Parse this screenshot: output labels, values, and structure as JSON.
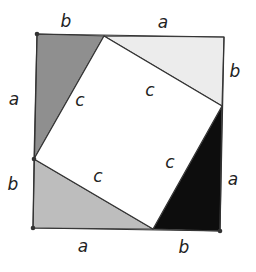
{
  "diagram": {
    "outer_square": {
      "points": [
        [
          37,
          34
        ],
        [
          224,
          37
        ],
        [
          220,
          231
        ],
        [
          33,
          228
        ]
      ],
      "stroke": "#333333"
    },
    "inner_square": {
      "points": [
        [
          104,
          36
        ],
        [
          222,
          106
        ],
        [
          153,
          229
        ],
        [
          34,
          159
        ]
      ],
      "fill": "#ffffff",
      "stroke": "#333333"
    },
    "triangles": [
      {
        "name": "top-left-triangle",
        "points": [
          [
            37,
            34
          ],
          [
            104,
            36
          ],
          [
            34,
            159
          ]
        ],
        "fill": "#8f8f8f"
      },
      {
        "name": "top-right-triangle",
        "points": [
          [
            104,
            36
          ],
          [
            224,
            37
          ],
          [
            222,
            106
          ]
        ],
        "fill": "#ececec"
      },
      {
        "name": "bottom-right-triangle",
        "points": [
          [
            222,
            106
          ],
          [
            220,
            231
          ],
          [
            153,
            229
          ]
        ],
        "fill": "#0d0d0d"
      },
      {
        "name": "bottom-left-triangle",
        "points": [
          [
            34,
            159
          ],
          [
            153,
            229
          ],
          [
            33,
            228
          ]
        ],
        "fill": "#bdbdbd"
      }
    ],
    "vertices": [
      [
        37,
        34
      ],
      [
        33,
        228
      ],
      [
        34,
        159
      ],
      [
        220,
        231
      ]
    ],
    "labels": [
      {
        "name": "label-top-b",
        "text": "b",
        "x": 66,
        "y": 27
      },
      {
        "name": "label-top-a",
        "text": "a",
        "x": 163,
        "y": 28
      },
      {
        "name": "label-right-b",
        "text": "b",
        "x": 235,
        "y": 77
      },
      {
        "name": "label-right-a",
        "text": "a",
        "x": 233,
        "y": 185
      },
      {
        "name": "label-bottom-b",
        "text": "b",
        "x": 184,
        "y": 253
      },
      {
        "name": "label-bottom-a",
        "text": "a",
        "x": 83,
        "y": 252
      },
      {
        "name": "label-left-b",
        "text": "b",
        "x": 13,
        "y": 190
      },
      {
        "name": "label-left-a",
        "text": "a",
        "x": 14,
        "y": 105
      },
      {
        "name": "label-c-1",
        "text": "c",
        "x": 80,
        "y": 106
      },
      {
        "name": "label-c-2",
        "text": "c",
        "x": 150,
        "y": 96
      },
      {
        "name": "label-c-3",
        "text": "c",
        "x": 170,
        "y": 168
      },
      {
        "name": "label-c-4",
        "text": "c",
        "x": 98,
        "y": 182
      }
    ]
  }
}
